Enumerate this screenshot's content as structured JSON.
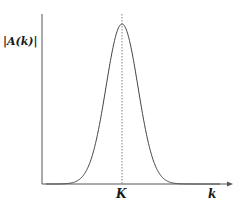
{
  "chart_data": {
    "type": "line",
    "title": "",
    "xlabel": "k",
    "ylabel": "|A(k)|",
    "x_tick_labels": [
      "K"
    ],
    "y_tick_labels": [],
    "grid": false,
    "legend": null,
    "annotations": [
      {
        "type": "dashed-vertical-line",
        "at": "K",
        "description": "peak location"
      }
    ],
    "series": [
      {
        "name": "|A(k)|",
        "shape": "gaussian",
        "center": "K",
        "description": "Single bell-shaped peak centered at k = K, decaying to zero on both sides"
      }
    ],
    "axis_style": {
      "x_arrow": true,
      "y_arrow": false
    }
  },
  "labels": {
    "y_axis": "|A(k)|",
    "peak": "K",
    "x_axis": "k"
  },
  "colors": {
    "axis": "#555555",
    "curve": "#444444",
    "dashed": "#666666",
    "text": "#1a1a1a"
  },
  "geometry": {
    "origin_x": 42,
    "origin_y": 184,
    "y_top": 14,
    "x_end": 232,
    "peak_x": 122,
    "peak_y": 24,
    "sigma_px": 16
  }
}
